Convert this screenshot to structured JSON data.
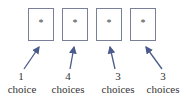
{
  "diagram": {
    "boxes": [
      {
        "symbol": "*"
      },
      {
        "symbol": "*"
      },
      {
        "symbol": "*"
      },
      {
        "symbol": "*"
      }
    ],
    "labels": [
      {
        "count": "1",
        "unit": "choice"
      },
      {
        "count": "4",
        "unit": "choices"
      },
      {
        "count": "3",
        "unit": "choices"
      },
      {
        "count": "3",
        "unit": "choices"
      }
    ],
    "colors": {
      "box_border": "#7a7f98",
      "arrow": "#4a5a8a",
      "text": "#333333"
    }
  }
}
